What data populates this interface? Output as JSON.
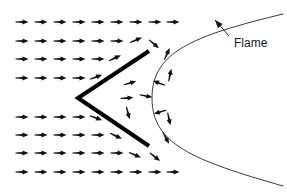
{
  "figure": {
    "background_color": "#ffffff",
    "width": 287,
    "height": 196
  },
  "annotations": {
    "flame_label": "Flame",
    "flame_label_x": 234,
    "flame_label_y": 44,
    "leader_line": {
      "from_x": 229,
      "from_y": 36,
      "to_x": 215,
      "to_y": 20,
      "arrowhead": "at-curve"
    }
  },
  "colors": {
    "line": "#000000",
    "flame_curve": "#3a3a3a",
    "arrow": "#111111",
    "label_text": "#1a1a1a",
    "background": "#ffffff"
  },
  "flame_holder": {
    "name": "v-gutter",
    "stroke_width": 4,
    "vertex": [
      78,
      98
    ],
    "upper_arm_end": [
      149,
      51
    ],
    "lower_arm_end": [
      149,
      146
    ]
  },
  "flame_front": {
    "name": "flame-front-curve",
    "stroke_width": 1,
    "type": "parabola-opening-right",
    "apex": [
      152,
      98
    ],
    "upper_end": [
      283,
      14
    ],
    "lower_end": [
      283,
      186
    ]
  },
  "chart_data": {
    "type": "scatter",
    "xlabel": "",
    "ylabel": "",
    "grid": false,
    "legend": null,
    "arrow_note": "Each datum is a velocity vector: x, y position in px, angle in degrees (0 = pointing right, positive = clockwise on screen), length in px.",
    "vectors": [
      {
        "x": 22,
        "y": 22,
        "angle": 0,
        "len": 13
      },
      {
        "x": 41,
        "y": 22,
        "angle": 0,
        "len": 13
      },
      {
        "x": 60,
        "y": 22,
        "angle": 0,
        "len": 13
      },
      {
        "x": 79,
        "y": 22,
        "angle": 0,
        "len": 13
      },
      {
        "x": 98,
        "y": 22,
        "angle": 0,
        "len": 13
      },
      {
        "x": 117,
        "y": 22,
        "angle": 0,
        "len": 13
      },
      {
        "x": 136,
        "y": 22,
        "angle": 0,
        "len": 13
      },
      {
        "x": 155,
        "y": 22,
        "angle": 0,
        "len": 13
      },
      {
        "x": 173,
        "y": 22,
        "angle": 0,
        "len": 13
      },
      {
        "x": 22,
        "y": 41,
        "angle": 0,
        "len": 13
      },
      {
        "x": 41,
        "y": 41,
        "angle": 0,
        "len": 13
      },
      {
        "x": 60,
        "y": 41,
        "angle": 0,
        "len": 13
      },
      {
        "x": 79,
        "y": 41,
        "angle": 0,
        "len": 13
      },
      {
        "x": 98,
        "y": 41,
        "angle": 0,
        "len": 13
      },
      {
        "x": 117,
        "y": 41,
        "angle": 0,
        "len": 13
      },
      {
        "x": 136,
        "y": 40,
        "angle": -22,
        "len": 13
      },
      {
        "x": 154,
        "y": 44,
        "angle": 40,
        "len": 13
      },
      {
        "x": 22,
        "y": 59,
        "angle": 0,
        "len": 13
      },
      {
        "x": 41,
        "y": 59,
        "angle": 0,
        "len": 13
      },
      {
        "x": 60,
        "y": 59,
        "angle": 0,
        "len": 13
      },
      {
        "x": 79,
        "y": 59,
        "angle": 0,
        "len": 13
      },
      {
        "x": 98,
        "y": 59,
        "angle": 0,
        "len": 13
      },
      {
        "x": 115,
        "y": 58,
        "angle": -25,
        "len": 13
      },
      {
        "x": 167,
        "y": 54,
        "angle": -65,
        "len": 13
      },
      {
        "x": 22,
        "y": 78,
        "angle": 0,
        "len": 13
      },
      {
        "x": 41,
        "y": 78,
        "angle": 0,
        "len": 13
      },
      {
        "x": 60,
        "y": 78,
        "angle": 0,
        "len": 13
      },
      {
        "x": 79,
        "y": 78,
        "angle": 0,
        "len": 13
      },
      {
        "x": 96,
        "y": 77,
        "angle": -20,
        "len": 13
      },
      {
        "x": 170,
        "y": 75,
        "angle": -78,
        "len": 13
      },
      {
        "x": 159,
        "y": 83,
        "angle": 200,
        "len": 13
      },
      {
        "x": 130,
        "y": 83,
        "angle": -15,
        "len": 13
      },
      {
        "x": 127,
        "y": 98,
        "angle": -5,
        "len": 13
      },
      {
        "x": 146,
        "y": 96,
        "angle": 12,
        "len": 13
      },
      {
        "x": 22,
        "y": 117,
        "angle": 0,
        "len": 13
      },
      {
        "x": 41,
        "y": 117,
        "angle": 0,
        "len": 13
      },
      {
        "x": 60,
        "y": 117,
        "angle": 0,
        "len": 13
      },
      {
        "x": 79,
        "y": 117,
        "angle": 0,
        "len": 13
      },
      {
        "x": 96,
        "y": 118,
        "angle": 20,
        "len": 13
      },
      {
        "x": 128,
        "y": 113,
        "angle": 75,
        "len": 13
      },
      {
        "x": 160,
        "y": 112,
        "angle": 165,
        "len": 13
      },
      {
        "x": 169,
        "y": 119,
        "angle": 78,
        "len": 13
      },
      {
        "x": 22,
        "y": 135,
        "angle": 0,
        "len": 13
      },
      {
        "x": 41,
        "y": 135,
        "angle": 0,
        "len": 13
      },
      {
        "x": 60,
        "y": 135,
        "angle": 0,
        "len": 13
      },
      {
        "x": 79,
        "y": 135,
        "angle": 0,
        "len": 13
      },
      {
        "x": 98,
        "y": 135,
        "angle": 0,
        "len": 13
      },
      {
        "x": 116,
        "y": 136,
        "angle": 25,
        "len": 13
      },
      {
        "x": 166,
        "y": 138,
        "angle": 62,
        "len": 13
      },
      {
        "x": 22,
        "y": 153,
        "angle": 0,
        "len": 13
      },
      {
        "x": 41,
        "y": 153,
        "angle": 0,
        "len": 13
      },
      {
        "x": 60,
        "y": 153,
        "angle": 0,
        "len": 13
      },
      {
        "x": 79,
        "y": 153,
        "angle": 0,
        "len": 13
      },
      {
        "x": 98,
        "y": 153,
        "angle": 0,
        "len": 13
      },
      {
        "x": 117,
        "y": 153,
        "angle": 0,
        "len": 13
      },
      {
        "x": 135,
        "y": 155,
        "angle": 22,
        "len": 13
      },
      {
        "x": 155,
        "y": 157,
        "angle": 38,
        "len": 13
      },
      {
        "x": 22,
        "y": 172,
        "angle": 0,
        "len": 13
      },
      {
        "x": 41,
        "y": 172,
        "angle": 0,
        "len": 13
      },
      {
        "x": 60,
        "y": 172,
        "angle": 0,
        "len": 13
      },
      {
        "x": 79,
        "y": 172,
        "angle": 0,
        "len": 13
      },
      {
        "x": 98,
        "y": 172,
        "angle": 0,
        "len": 13
      },
      {
        "x": 117,
        "y": 172,
        "angle": 0,
        "len": 13
      },
      {
        "x": 136,
        "y": 172,
        "angle": 0,
        "len": 13
      },
      {
        "x": 155,
        "y": 172,
        "angle": 0,
        "len": 13
      },
      {
        "x": 173,
        "y": 172,
        "angle": 0,
        "len": 13
      }
    ]
  }
}
